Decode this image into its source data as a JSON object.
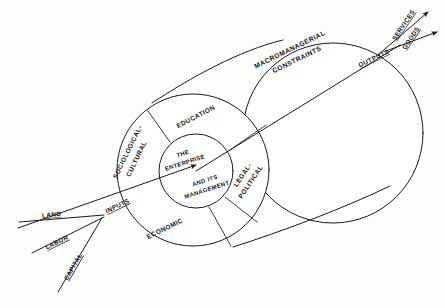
{
  "diagram": {
    "type": "systems-cylinder-diagram",
    "background_color": "#fdfdfc",
    "line_color": "#1a1a1a",
    "core": {
      "line1": "THE",
      "line2": "ENTERPRISE",
      "line3": "AND ITS",
      "line4": "MANAGEMENT"
    },
    "sectors": [
      {
        "id": "sociological-cultural",
        "line1": "SOCIOLOGICAL-",
        "line2": "CULTURAL"
      },
      {
        "id": "education",
        "line1": "EDUCATION",
        "line2": ""
      },
      {
        "id": "legal-political",
        "line1": "LEGAL-",
        "line2": "POLITICAL"
      },
      {
        "id": "economic",
        "line1": "ECONOMIC",
        "line2": ""
      }
    ],
    "band": {
      "line1": "MACROMANAGERIAL",
      "line2": "CONSTRAINTS"
    },
    "inputs": {
      "label": "INPUTS",
      "items": [
        {
          "id": "land",
          "label": "LAND"
        },
        {
          "id": "labor",
          "label": "LABOR"
        },
        {
          "id": "capital",
          "label": "CAPITAL"
        }
      ]
    },
    "outputs": {
      "label": "OUTPUTS",
      "items": [
        {
          "id": "services",
          "label": "SERVICES"
        },
        {
          "id": "goods",
          "label": "GOODS"
        }
      ]
    }
  }
}
